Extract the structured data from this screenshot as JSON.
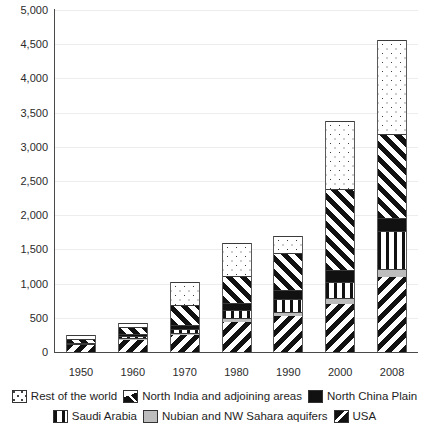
{
  "chart_data": {
    "type": "bar",
    "subtype": "stacked-bar",
    "title": "",
    "xlabel": "",
    "ylabel": "",
    "ylim": [
      0,
      5000
    ],
    "grid": true,
    "legend_position": "bottom",
    "categories": [
      "1950",
      "1960",
      "1970",
      "1980",
      "1990",
      "2000",
      "2008"
    ],
    "yticks": [
      "0",
      "500",
      "1,000",
      "1,500",
      "2,000",
      "2,500",
      "3,000",
      "3,500",
      "4,000",
      "4,500",
      "5,000"
    ],
    "ytick_values": [
      0,
      500,
      1000,
      1500,
      2000,
      2500,
      3000,
      3500,
      4000,
      4500,
      5000
    ],
    "series": [
      {
        "name": "USA",
        "values": [
          100,
          180,
          250,
          440,
          520,
          700,
          1100
        ]
      },
      {
        "name": "Nubian and NW Sahara aquifers",
        "values": [
          10,
          20,
          30,
          50,
          70,
          90,
          110
        ]
      },
      {
        "name": "Saudi Arabia",
        "values": [
          10,
          30,
          60,
          120,
          180,
          240,
          560
        ]
      },
      {
        "name": "North China Plain",
        "values": [
          15,
          30,
          60,
          110,
          130,
          170,
          190
        ]
      },
      {
        "name": "North India and adjoining areas",
        "values": [
          55,
          100,
          290,
          390,
          550,
          1180,
          1230
        ]
      },
      {
        "name": "Rest of the world",
        "values": [
          60,
          70,
          340,
          490,
          250,
          1000,
          1370
        ]
      }
    ],
    "totals": [
      250,
      430,
      1030,
      1600,
      1700,
      3380,
      4560
    ],
    "stack_order_bottom_to_top": [
      "USA",
      "Nubian and NW Sahara aquifers",
      "Saudi Arabia",
      "North China Plain",
      "North India and adjoining areas",
      "Rest of the world"
    ],
    "patterns": {
      "Rest of the world": "dotted",
      "North India and adjoining areas": "diagonal-hatch-forward",
      "North China Plain": "solid-black",
      "Saudi Arabia": "vertical-stripes",
      "Nubian and NW Sahara aquifers": "solid-light-grey",
      "USA": "diagonal-hatch-back"
    }
  },
  "legend": {
    "row1": [
      {
        "label": "Rest of the world",
        "pattern_class": "p-rest",
        "icon": "legend-swatch-dotted"
      },
      {
        "label": "North India and adjoining areas",
        "pattern_class": "p-nindia",
        "icon": "legend-swatch-hatch-forward"
      },
      {
        "label": "North China Plain",
        "pattern_class": "p-nchina",
        "icon": "legend-swatch-solid-black"
      }
    ],
    "row2": [
      {
        "label": "Saudi Arabia",
        "pattern_class": "p-saudi",
        "icon": "legend-swatch-vertical-stripes"
      },
      {
        "label": "Nubian and NW Sahara aquifers",
        "pattern_class": "p-nubian",
        "icon": "legend-swatch-solid-grey"
      },
      {
        "label": "USA",
        "pattern_class": "p-usa",
        "icon": "legend-swatch-hatch-back"
      }
    ]
  },
  "colors": {
    "background": "#ffffff",
    "axis": "#4a4a4a",
    "grid": "#ededed",
    "ink": "#111111",
    "grey_fill": "#bdbdbd",
    "text": "#2b2b2b"
  }
}
